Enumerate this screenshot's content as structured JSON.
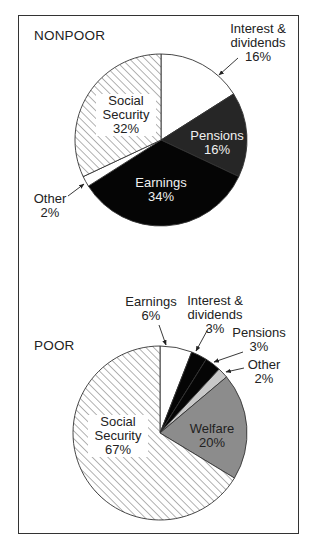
{
  "chart_data": [
    {
      "type": "pie",
      "title": "NONPOOR",
      "start_angle_deg": 0,
      "direction": "clockwise",
      "slices": [
        {
          "label": "Interest & dividends",
          "value": 16,
          "display": "Interest &\ndividends\n16%",
          "fill": "#ffffff",
          "pattern": "none"
        },
        {
          "label": "Pensions",
          "value": 16,
          "display": "Pensions\n16%",
          "fill": "#262626",
          "pattern": "none"
        },
        {
          "label": "Earnings",
          "value": 34,
          "display": "Earnings\n34%",
          "fill": "#050505",
          "pattern": "none"
        },
        {
          "label": "Other",
          "value": 2,
          "display": "Other\n2%",
          "fill": "#ffffff",
          "pattern": "none"
        },
        {
          "label": "Social Security",
          "value": 32,
          "display": "Social\nSecurity\n32%",
          "fill": "#ffffff",
          "pattern": "hatch"
        }
      ]
    },
    {
      "type": "pie",
      "title": "POOR",
      "start_angle_deg": 0,
      "direction": "clockwise",
      "slices": [
        {
          "label": "Earnings",
          "value": 6,
          "display": "Earnings\n6%",
          "fill": "#ffffff",
          "pattern": "none"
        },
        {
          "label": "Interest & dividends",
          "value": 3,
          "display": "Interest &\ndividends\n3%",
          "fill": "#050505",
          "pattern": "none"
        },
        {
          "label": "Pensions",
          "value": 3,
          "display": "Pensions\n3%",
          "fill": "#050505",
          "pattern": "none"
        },
        {
          "label": "Other",
          "value": 2,
          "display": "Other\n2%",
          "fill": "#c8c8c8",
          "pattern": "none"
        },
        {
          "label": "Welfare",
          "value": 20,
          "display": "Welfare\n20%",
          "fill": "#8c8c8c",
          "pattern": "none"
        },
        {
          "label": "Social Security",
          "value": 67,
          "display": "Social\nSecurity\n67%",
          "fill": "#ffffff",
          "pattern": "hatch"
        }
      ]
    }
  ],
  "panels": {
    "nonpoor": {
      "title": "NONPOOR",
      "labels": {
        "interest": "Interest &\ndividends\n16%",
        "pensions": "Pensions\n16%",
        "earnings": "Earnings\n34%",
        "other": "Other\n2%",
        "social_security": "Social\nSecurity\n32%"
      }
    },
    "poor": {
      "title": "POOR",
      "labels": {
        "earnings": "Earnings\n6%",
        "interest": "Interest &\ndividends\n3%",
        "pensions": "Pensions\n3%",
        "other": "Other\n2%",
        "welfare": "Welfare\n20%",
        "social_security": "Social\nSecurity\n67%"
      }
    }
  },
  "colors": {
    "outline": "#333333",
    "hatch": "#555555"
  }
}
